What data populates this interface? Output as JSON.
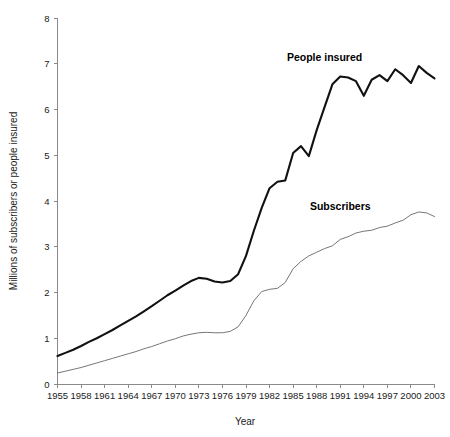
{
  "chart_data": {
    "type": "line",
    "title": "",
    "xlabel": "Year",
    "ylabel": "Millions of subscribers or people insured",
    "xlim": [
      1955,
      2003
    ],
    "ylim": [
      0,
      8
    ],
    "grid": false,
    "legend_position": "inline-annotations",
    "y_ticks": [
      0,
      1,
      2,
      3,
      4,
      5,
      6,
      7,
      8
    ],
    "y_tick_labels": [
      "0",
      "1",
      "2",
      "3",
      "4",
      "5",
      "6",
      "7",
      "8"
    ],
    "x_ticks": [
      1955,
      1958,
      1961,
      1964,
      1967,
      1970,
      1973,
      1976,
      1979,
      1982,
      1985,
      1988,
      1991,
      1994,
      1997,
      2000,
      2003
    ],
    "x_tick_labels": [
      "1955",
      "1958",
      "1961",
      "1964",
      "1967",
      "1970",
      "1973",
      "1976",
      "1979",
      "1982",
      "1985",
      "1988",
      "1991",
      "1994",
      "1997",
      "2000",
      "2003"
    ],
    "x": [
      1955,
      1956,
      1957,
      1958,
      1959,
      1960,
      1961,
      1962,
      1963,
      1964,
      1965,
      1966,
      1967,
      1968,
      1969,
      1970,
      1971,
      1972,
      1973,
      1974,
      1975,
      1976,
      1977,
      1978,
      1979,
      1980,
      1981,
      1982,
      1983,
      1984,
      1985,
      1986,
      1987,
      1988,
      1989,
      1990,
      1991,
      1992,
      1993,
      1994,
      1995,
      1996,
      1997,
      1998,
      1999,
      2000,
      2001,
      2002,
      2003
    ],
    "series": [
      {
        "name": "People insured",
        "color": "#111111",
        "style": "thick",
        "label_x": 1989,
        "label_y": 7.05,
        "values": [
          0.61,
          0.68,
          0.75,
          0.83,
          0.92,
          1.0,
          1.09,
          1.18,
          1.28,
          1.38,
          1.48,
          1.59,
          1.7,
          1.82,
          1.94,
          2.04,
          2.15,
          2.25,
          2.32,
          2.3,
          2.24,
          2.22,
          2.25,
          2.4,
          2.8,
          3.35,
          3.85,
          4.28,
          4.42,
          4.45,
          5.05,
          5.2,
          4.98,
          5.55,
          6.05,
          6.55,
          6.72,
          6.7,
          6.62,
          6.3,
          6.65,
          6.75,
          6.62,
          6.88,
          6.75,
          6.58,
          6.95,
          6.8,
          6.68
        ]
      },
      {
        "name": "Subscribers",
        "color": "#6f6f6f",
        "style": "thin",
        "label_x": 1991,
        "label_y": 3.8,
        "values": [
          0.24,
          0.28,
          0.32,
          0.36,
          0.41,
          0.46,
          0.51,
          0.56,
          0.61,
          0.66,
          0.71,
          0.77,
          0.82,
          0.88,
          0.94,
          0.99,
          1.05,
          1.09,
          1.12,
          1.13,
          1.12,
          1.12,
          1.15,
          1.25,
          1.5,
          1.82,
          2.02,
          2.07,
          2.09,
          2.22,
          2.52,
          2.68,
          2.8,
          2.88,
          2.96,
          3.02,
          3.16,
          3.22,
          3.3,
          3.34,
          3.36,
          3.42,
          3.45,
          3.52,
          3.58,
          3.7,
          3.76,
          3.74,
          3.66
        ]
      }
    ]
  },
  "labels": {
    "people_insured": "People insured",
    "subscribers": "Subscribers",
    "x_axis_title": "Year",
    "y_axis_title": "Millions of subscribers or people insured"
  }
}
